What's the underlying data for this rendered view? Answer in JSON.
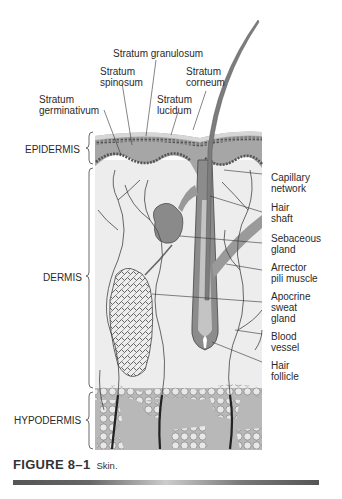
{
  "figure": {
    "number": "FIGURE 8–1",
    "caption": "Skin."
  },
  "layers": [
    {
      "id": "epidermis",
      "label": "EPIDERMIS"
    },
    {
      "id": "dermis",
      "label": "DERMIS"
    },
    {
      "id": "hypodermis",
      "label": "HYPODERMIS"
    }
  ],
  "epidermis_strata": [
    {
      "id": "granulosum",
      "label": "Stratum granulosum"
    },
    {
      "id": "spinosum",
      "line1": "Stratum",
      "line2": "spinosum"
    },
    {
      "id": "corneum",
      "line1": "Stratum",
      "line2": "corneum"
    },
    {
      "id": "germinativum",
      "line1": "Stratum",
      "line2": "germinativum"
    },
    {
      "id": "lucidum",
      "line1": "Stratum",
      "line2": "lucidum"
    }
  ],
  "right_labels": [
    {
      "id": "capillary",
      "line1": "Capillary",
      "line2": "network"
    },
    {
      "id": "hairshaft",
      "line1": "Hair",
      "line2": "shaft"
    },
    {
      "id": "sebaceous",
      "line1": "Sebaceous",
      "line2": "gland"
    },
    {
      "id": "arrector",
      "line1": "Arrector",
      "line2": "pili muscle"
    },
    {
      "id": "apocrine",
      "line1": "Apocrine",
      "line2": "sweat",
      "line3": "gland"
    },
    {
      "id": "blood",
      "line1": "Blood",
      "line2": "vessel"
    },
    {
      "id": "follicle",
      "line1": "Hair",
      "line2": "follicle"
    }
  ],
  "colors": {
    "epidermis": "#a9a9a9",
    "dermis": "#ececec",
    "hypodermis": "#b4b4b4",
    "fat_cells": "#e6e6e6",
    "hair": "#7a7a7a",
    "vessel": "#333333"
  }
}
